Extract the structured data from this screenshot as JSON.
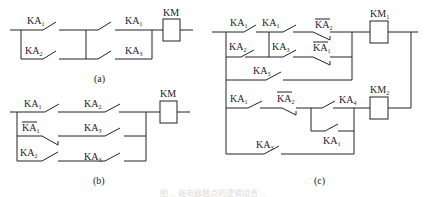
{
  "figure": {
    "caption_faint": "图 ... 继电器触点的逻辑组合 ...",
    "panels": [
      {
        "id": "a",
        "caption": "(a)",
        "coil": {
          "name": "KM",
          "sub": ""
        },
        "contacts": [
          {
            "name": "KA",
            "sub": "1",
            "type": "NO"
          },
          {
            "name": "KA",
            "sub": "2",
            "type": "NO"
          },
          {
            "name": "KA",
            "sub": "1",
            "type": "NO"
          },
          {
            "name": "KA",
            "sub": "3",
            "type": "NO"
          }
        ]
      },
      {
        "id": "b",
        "caption": "(b)",
        "coil": {
          "name": "KM",
          "sub": ""
        },
        "contacts": [
          {
            "name": "KA",
            "sub": "1",
            "type": "NO"
          },
          {
            "name": "KA",
            "sub": "2",
            "type": "NO"
          },
          {
            "name": "KA",
            "sub": "1",
            "type": "NC"
          },
          {
            "name": "KA",
            "sub": "3",
            "type": "NO"
          },
          {
            "name": "KA",
            "sub": "2",
            "type": "NO"
          },
          {
            "name": "KA",
            "sub": "3",
            "type": "NO"
          }
        ]
      },
      {
        "id": "c",
        "caption": "(c)",
        "coils": [
          {
            "name": "KM",
            "sub": "1"
          },
          {
            "name": "KM",
            "sub": "2"
          }
        ],
        "contacts": [
          {
            "name": "KA",
            "sub": "1",
            "type": "NO"
          },
          {
            "name": "KA",
            "sub": "1",
            "type": "NO"
          },
          {
            "name": "KA",
            "sub": "2",
            "type": "NC"
          },
          {
            "name": "KA",
            "sub": "2",
            "type": "NO"
          },
          {
            "name": "KA",
            "sub": "3",
            "type": "NO"
          },
          {
            "name": "KA",
            "sub": "1",
            "type": "NC"
          },
          {
            "name": "KA",
            "sub": "3",
            "type": "NO"
          },
          {
            "name": "KA",
            "sub": "1",
            "type": "NO"
          },
          {
            "name": "KA",
            "sub": "2",
            "type": "NC"
          },
          {
            "name": "KA",
            "sub": "4",
            "type": "NO"
          },
          {
            "name": "KA",
            "sub": "1",
            "type": "NO"
          },
          {
            "name": "KA",
            "sub": "3",
            "type": "NO"
          }
        ]
      }
    ]
  }
}
